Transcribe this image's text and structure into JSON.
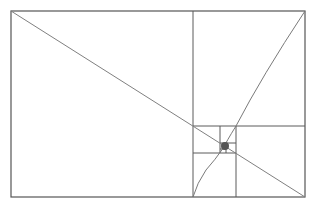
{
  "diagram": {
    "title": "",
    "type": "golden-ratio-spiral",
    "colors": {
      "background": "#ffffff",
      "frame_stroke": "#555555",
      "grid_stroke": "#5a5a5a",
      "diagonal_stroke": "#808080",
      "curve_stroke": "#7a7a7a",
      "center_dot": "#555555"
    },
    "outer_rect": {
      "x": 11,
      "y": 11,
      "width": 294,
      "height": 186
    },
    "divisions": [
      {
        "name": "vertical-major",
        "x1": 193,
        "y1": 11,
        "x2": 193,
        "y2": 197
      },
      {
        "name": "horizontal-right",
        "x1": 193,
        "y1": 126,
        "x2": 305,
        "y2": 126
      },
      {
        "name": "vertical-lower",
        "x1": 236,
        "y1": 126,
        "x2": 236,
        "y2": 197
      },
      {
        "name": "horizontal-lower-left",
        "x1": 193,
        "y1": 153,
        "x2": 236,
        "y2": 153
      },
      {
        "name": "vertical-small",
        "x1": 220,
        "y1": 126,
        "x2": 220,
        "y2": 153
      },
      {
        "name": "horizontal-small",
        "x1": 220,
        "y1": 143,
        "x2": 236,
        "y2": 143
      },
      {
        "name": "vertical-tiny",
        "x1": 226,
        "y1": 143,
        "x2": 226,
        "y2": 153
      },
      {
        "name": "horizontal-tiny",
        "x1": 220,
        "y1": 149,
        "x2": 226,
        "y2": 149
      }
    ],
    "diagonal": {
      "x1": 11,
      "y1": 11,
      "x2": 305,
      "y2": 197
    },
    "spiral_curve": "M 305 11 Q 262 76 236 126 Q 226 142 224 147 Q 215 160 206 170 Q 197 183 193 197",
    "center_point": {
      "cx": 225,
      "cy": 146,
      "r": 4
    }
  }
}
